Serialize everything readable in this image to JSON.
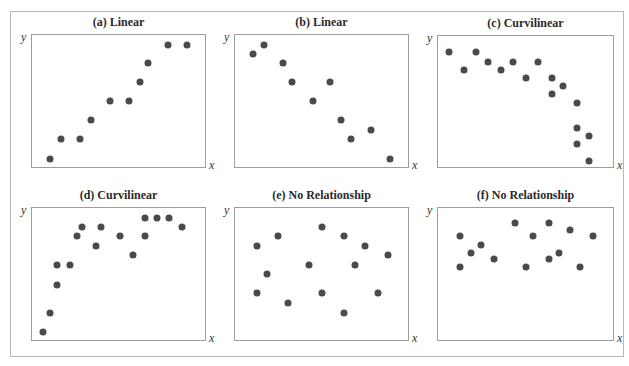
{
  "figure": {
    "frame_color": "#b9b9b9",
    "dot_color": "#4a4a4e",
    "axis_labels": {
      "x": "x",
      "y": "y"
    }
  },
  "chart_data": [
    {
      "type": "scatter",
      "title": "(a) Linear",
      "xlabel": "x",
      "ylabel": "y",
      "grid": false,
      "points": [
        [
          11,
          7
        ],
        [
          17,
          22
        ],
        [
          28,
          22
        ],
        [
          34,
          36
        ],
        [
          45,
          50
        ],
        [
          56,
          50
        ],
        [
          62,
          64
        ],
        [
          67,
          78
        ],
        [
          78,
          92
        ],
        [
          89,
          92
        ]
      ]
    },
    {
      "type": "scatter",
      "title": "(b) Linear",
      "xlabel": "x",
      "ylabel": "y",
      "grid": false,
      "points": [
        [
          11,
          85
        ],
        [
          17,
          92
        ],
        [
          28,
          78
        ],
        [
          33,
          64
        ],
        [
          45,
          50
        ],
        [
          55,
          64
        ],
        [
          61,
          36
        ],
        [
          67,
          22
        ],
        [
          78,
          28
        ],
        [
          89,
          7
        ]
      ]
    },
    {
      "type": "scatter",
      "title": "(c) Curvilinear",
      "xlabel": "x",
      "ylabel": "y",
      "grid": false,
      "points": [
        [
          7,
          87
        ],
        [
          15,
          74
        ],
        [
          22,
          87
        ],
        [
          29,
          80
        ],
        [
          36,
          74
        ],
        [
          43,
          80
        ],
        [
          50,
          68
        ],
        [
          57,
          80
        ],
        [
          65,
          68
        ],
        [
          65,
          56
        ],
        [
          71,
          62
        ],
        [
          79,
          49
        ],
        [
          79,
          30
        ],
        [
          86,
          24
        ],
        [
          79,
          18
        ],
        [
          86,
          5
        ]
      ]
    },
    {
      "type": "scatter",
      "title": "(d) Curvilinear",
      "xlabel": "x",
      "ylabel": "y",
      "grid": false,
      "points": [
        [
          7,
          7
        ],
        [
          11,
          21
        ],
        [
          15,
          42
        ],
        [
          15,
          57
        ],
        [
          22,
          57
        ],
        [
          26,
          78
        ],
        [
          29,
          85
        ],
        [
          37,
          71
        ],
        [
          40,
          85
        ],
        [
          51,
          78
        ],
        [
          58,
          64
        ],
        [
          65,
          78
        ],
        [
          65,
          92
        ],
        [
          72,
          92
        ],
        [
          79,
          92
        ],
        [
          86,
          85
        ]
      ]
    },
    {
      "type": "scatter",
      "title": "(e) No Relationship",
      "xlabel": "x",
      "ylabel": "y",
      "grid": false,
      "points": [
        [
          13,
          71
        ],
        [
          19,
          50
        ],
        [
          13,
          36
        ],
        [
          25,
          78
        ],
        [
          31,
          28
        ],
        [
          43,
          57
        ],
        [
          50,
          85
        ],
        [
          50,
          36
        ],
        [
          63,
          78
        ],
        [
          69,
          57
        ],
        [
          63,
          21
        ],
        [
          75,
          71
        ],
        [
          82,
          36
        ],
        [
          88,
          64
        ]
      ]
    },
    {
      "type": "scatter",
      "title": "(f) No Relationship",
      "xlabel": "x",
      "ylabel": "y",
      "grid": false,
      "points": [
        [
          13,
          78
        ],
        [
          13,
          55
        ],
        [
          19,
          66
        ],
        [
          25,
          72
        ],
        [
          32,
          61
        ],
        [
          44,
          88
        ],
        [
          50,
          55
        ],
        [
          54,
          78
        ],
        [
          63,
          88
        ],
        [
          63,
          61
        ],
        [
          69,
          66
        ],
        [
          75,
          83
        ],
        [
          81,
          55
        ],
        [
          88,
          78
        ]
      ]
    }
  ],
  "panels_layout": [
    {
      "left": 31,
      "top": 34,
      "width": 175,
      "height": 134
    },
    {
      "left": 234,
      "top": 34,
      "width": 175,
      "height": 134
    },
    {
      "left": 437,
      "top": 35,
      "width": 177,
      "height": 133
    },
    {
      "left": 31,
      "top": 207,
      "width": 175,
      "height": 134
    },
    {
      "left": 234,
      "top": 207,
      "width": 175,
      "height": 134
    },
    {
      "left": 437,
      "top": 207,
      "width": 177,
      "height": 134
    }
  ]
}
